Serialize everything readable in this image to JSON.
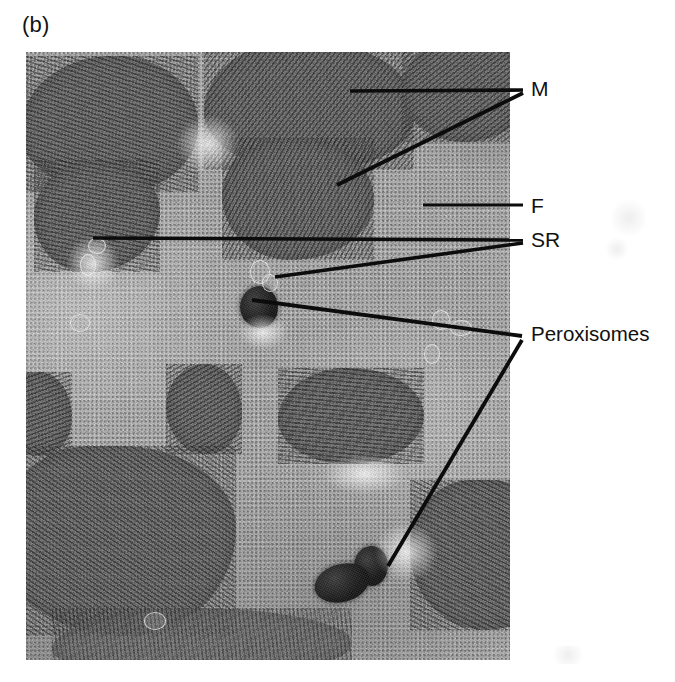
{
  "figure": {
    "panel_letter": "(b)",
    "type": "transmission-electron-micrograph"
  },
  "labels": [
    {
      "id": "M",
      "text": "M",
      "meaning": "mitochondria",
      "leader_style": "double-line-v",
      "x": 531,
      "y": 78
    },
    {
      "id": "F",
      "text": "F",
      "meaning": "myofibril",
      "leader_style": "single-line",
      "x": 531,
      "y": 195
    },
    {
      "id": "SR",
      "text": "SR",
      "meaning": "sarcoplasmic reticulum",
      "leader_style": "double-line-v",
      "x": 531,
      "y": 229
    },
    {
      "id": "Peroxisomes",
      "text": "Peroxisomes",
      "meaning": "peroxisomes",
      "leader_style": "double-line-v",
      "x": 531,
      "y": 324
    }
  ],
  "micrograph": {
    "left": 26,
    "top": 52,
    "width": 484,
    "height": 608,
    "background_color": "#b2b2b2",
    "mitochondria_color": "#6b6b6b",
    "peroxisome_color": "#141414"
  },
  "colors": {
    "page_background": "#ffffff",
    "text": "#111111",
    "leader_line": "#0c0c0c"
  }
}
